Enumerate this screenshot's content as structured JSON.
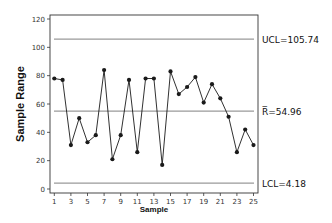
{
  "chart_data": {
    "type": "line",
    "title": "",
    "xlabel": "Sample",
    "ylabel": "Sample Range",
    "ylim": [
      0,
      120
    ],
    "xlim": [
      1,
      25
    ],
    "yticks": [
      0,
      20,
      40,
      60,
      80,
      100,
      120
    ],
    "xticks": [
      1,
      3,
      5,
      7,
      9,
      11,
      13,
      15,
      17,
      19,
      21,
      23,
      25
    ],
    "grid": false,
    "x": [
      1,
      2,
      3,
      4,
      5,
      6,
      7,
      8,
      9,
      10,
      11,
      12,
      13,
      14,
      15,
      16,
      17,
      18,
      19,
      20,
      21,
      22,
      23,
      24,
      25
    ],
    "series": [
      {
        "name": "Sample Range",
        "values": [
          78,
          77,
          31,
          50,
          33,
          38,
          84,
          21,
          38,
          77,
          26,
          78,
          78,
          17,
          83,
          67,
          72,
          79,
          61,
          74,
          64,
          51,
          26,
          42,
          31
        ]
      }
    ],
    "control_lines": [
      {
        "name": "UCL",
        "value": 105.74,
        "label": "UCL=105.74"
      },
      {
        "name": "R-bar",
        "value": 54.96,
        "label": "R̅=54.96"
      },
      {
        "name": "LCL",
        "value": 4.18,
        "label": "LCL=4.18"
      }
    ]
  },
  "colors": {
    "line": "#1a1a1a",
    "control_line": "#9a9a9a",
    "frame": "#333333"
  }
}
